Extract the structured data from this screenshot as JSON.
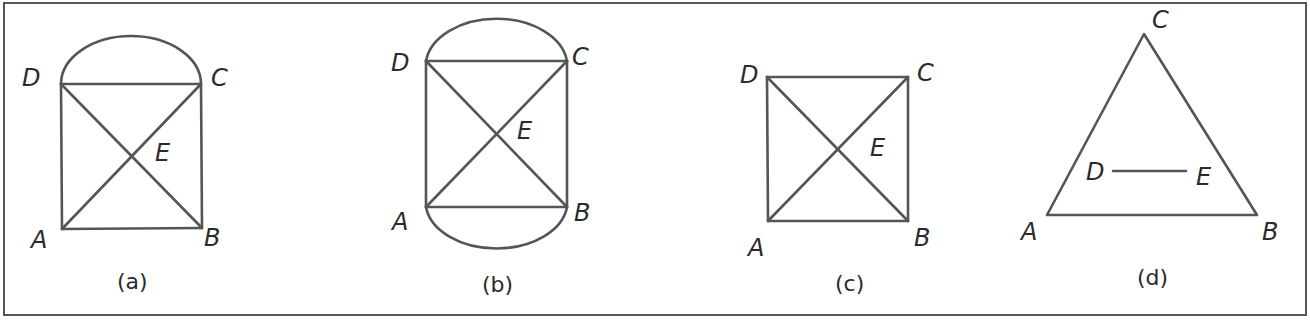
{
  "figure": {
    "colors": {
      "stroke": "#555555",
      "text": "#2b2b2b",
      "background": "#ffffff"
    },
    "panels": [
      {
        "id": "a",
        "caption": "(a)",
        "shape": "square with diagonals and semicircle on top side DC",
        "labels": {
          "A": "A",
          "B": "B",
          "C": "C",
          "D": "D",
          "E": "E"
        }
      },
      {
        "id": "b",
        "caption": "(b)",
        "shape": "rectangle with diagonals and semicircles on DC and AB",
        "labels": {
          "A": "A",
          "B": "B",
          "C": "C",
          "D": "D",
          "E": "E"
        }
      },
      {
        "id": "c",
        "caption": "(c)",
        "shape": "square with diagonals",
        "labels": {
          "A": "A",
          "B": "B",
          "C": "C",
          "D": "D",
          "E": "E"
        }
      },
      {
        "id": "d",
        "caption": "(d)",
        "shape": "triangle with midsegment DE",
        "labels": {
          "A": "A",
          "B": "B",
          "C": "C",
          "D": "D",
          "E": "E"
        }
      }
    ]
  }
}
